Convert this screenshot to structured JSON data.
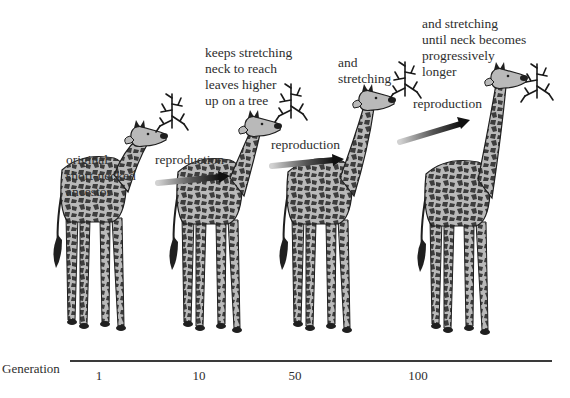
{
  "figure": {
    "stages": [
      {
        "generation": "1",
        "caption": [
          "original",
          "short-necked",
          "ancestor"
        ]
      },
      {
        "generation": "10",
        "caption": [
          "keeps stretching",
          "neck to reach",
          "leaves higher",
          "up on a tree"
        ]
      },
      {
        "generation": "50",
        "caption": [
          "and",
          "stretching"
        ]
      },
      {
        "generation": "100",
        "caption": [
          "and stretching",
          "until neck becomes",
          "progressively",
          "longer"
        ]
      }
    ],
    "arrows": [
      {
        "label": "reproduction"
      },
      {
        "label": "reproduction"
      },
      {
        "label": "reproduction"
      }
    ],
    "axis": {
      "label": "Generation",
      "ticks": [
        "1",
        "10",
        "50",
        "100"
      ]
    },
    "colors": {
      "giraffe_body": "#b9b9b9",
      "giraffe_spots": "#3d3d3d",
      "outline": "#1f1f1f",
      "text": "#2e2e2e",
      "arrow_dark": "#111111",
      "arrow_light": "#bdbdbd"
    }
  }
}
